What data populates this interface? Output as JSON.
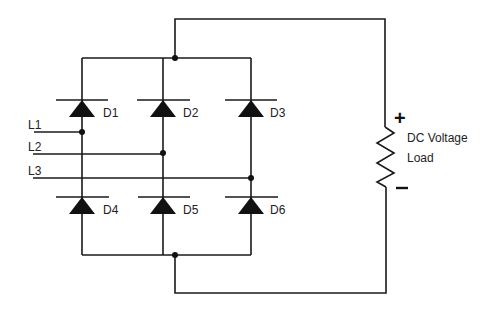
{
  "diagram": {
    "type": "three-phase full-wave bridge rectifier",
    "inputs": [
      {
        "label": "L1",
        "y": 132,
        "connects_to_column": 0
      },
      {
        "label": "L2",
        "y": 154,
        "connects_to_column": 1
      },
      {
        "label": "L3",
        "y": 178,
        "connects_to_column": 2
      }
    ],
    "columns_x": [
      82,
      163,
      251
    ],
    "upper_diodes": [
      {
        "label": "D1",
        "column": 0
      },
      {
        "label": "D2",
        "column": 1
      },
      {
        "label": "D3",
        "column": 2
      }
    ],
    "lower_diodes": [
      {
        "label": "D4",
        "column": 0
      },
      {
        "label": "D5",
        "column": 1
      },
      {
        "label": "D6",
        "column": 2
      }
    ],
    "load": {
      "label_line1": "DC Voltage",
      "label_line2": "Load",
      "positive_sign": "+",
      "negative_sign": "−"
    },
    "colors": {
      "line": "#1a1a1a",
      "background": "#ffffff"
    }
  }
}
